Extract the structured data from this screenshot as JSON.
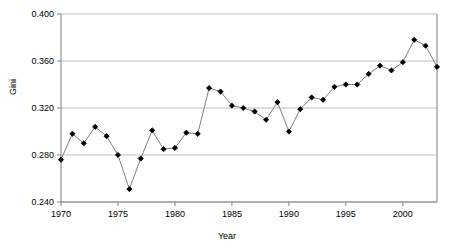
{
  "chart_data": {
    "type": "line",
    "title": "",
    "xlabel": "Year",
    "ylabel": "Gini",
    "xlim": [
      1970,
      2003
    ],
    "ylim": [
      0.24,
      0.4
    ],
    "yticks": [
      0.24,
      0.28,
      0.32,
      0.36,
      0.4
    ],
    "ytick_labels": [
      "0.240",
      "0.280",
      "0.320",
      "0.360",
      "0.400"
    ],
    "xticks": [
      1970,
      1975,
      1980,
      1985,
      1990,
      1995,
      2000
    ],
    "xtick_labels": [
      "1970",
      "1975",
      "1980",
      "1985",
      "1990",
      "1995",
      "2000"
    ],
    "grid": "horizontal",
    "legend": "none",
    "marker": "filled-diamond",
    "line_color": "#808080",
    "marker_color": "#000000",
    "grid_color": "#c0c0c0",
    "axis_color": "#808080",
    "background": "#ffffff",
    "x": [
      1970,
      1971,
      1972,
      1973,
      1974,
      1975,
      1976,
      1977,
      1978,
      1979,
      1980,
      1981,
      1982,
      1983,
      1984,
      1985,
      1986,
      1987,
      1988,
      1989,
      1990,
      1991,
      1992,
      1993,
      1994,
      1995,
      1996,
      1997,
      1998,
      1999,
      2000,
      2001,
      2002,
      2003
    ],
    "values": [
      0.276,
      0.298,
      0.29,
      0.304,
      0.296,
      0.28,
      0.251,
      0.277,
      0.301,
      0.285,
      0.286,
      0.299,
      0.298,
      0.337,
      0.334,
      0.322,
      0.32,
      0.317,
      0.31,
      0.325,
      0.3,
      0.319,
      0.329,
      0.327,
      0.338,
      0.34,
      0.34,
      0.349,
      0.356,
      0.352,
      0.359,
      0.378,
      0.373,
      0.355
    ],
    "series": [
      {
        "name": "Gini",
        "values": [
          0.276,
          0.298,
          0.29,
          0.304,
          0.296,
          0.28,
          0.251,
          0.277,
          0.301,
          0.285,
          0.286,
          0.299,
          0.298,
          0.337,
          0.334,
          0.322,
          0.32,
          0.317,
          0.31,
          0.325,
          0.3,
          0.319,
          0.329,
          0.327,
          0.338,
          0.34,
          0.34,
          0.349,
          0.356,
          0.352,
          0.359,
          0.378,
          0.373,
          0.355
        ]
      }
    ]
  }
}
